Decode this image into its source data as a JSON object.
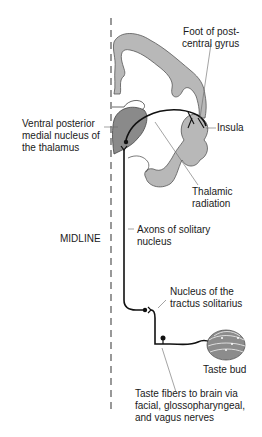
{
  "diagram": {
    "colors": {
      "cortex_fill": "#b8b8b8",
      "thalamus_fill": "#8a8a8a",
      "taste_bud_fill": "#8c8c8c",
      "pathway_stroke": "#111111",
      "leader_line": "#666666",
      "midline": "#555555"
    },
    "labels": {
      "foot_postcentral": "Foot of post-\ncentral gyrus",
      "vpm": "Ventral posterior\nmedial nucleus of\nthe thalamus",
      "insula": "Insula",
      "thalamic_radiation": "Thalamic\nradiation",
      "midline": "MIDLINE",
      "axons_solitary": "Axons of solitary\nnucleus",
      "nucleus_tractus": "Nucleus of the\ntractus solitarius",
      "taste_bud": "Taste bud",
      "taste_fibers": "Taste fibers to brain via\nfacial, glossopharyngeal,\nand vagus nerves"
    }
  }
}
